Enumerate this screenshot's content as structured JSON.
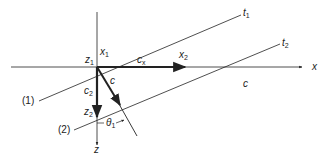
{
  "diagram": {
    "labels": {
      "x1": {
        "main": "x",
        "sub": "1"
      },
      "z1": {
        "main": "z",
        "sub": "1"
      },
      "cx": {
        "main": "c",
        "sub": "x"
      },
      "x2": {
        "main": "x",
        "sub": "2"
      },
      "c_arrow": {
        "main": "c",
        "sub": ""
      },
      "c2": {
        "main": "c",
        "sub": "2"
      },
      "z2": {
        "main": "z",
        "sub": "2"
      },
      "theta1": {
        "main": "θ",
        "sub": "1"
      },
      "t1": {
        "main": "t",
        "sub": "1"
      },
      "t2": {
        "main": "t",
        "sub": "2"
      },
      "x_axis": {
        "main": "x",
        "sub": ""
      },
      "z_axis": {
        "main": "z",
        "sub": ""
      },
      "c_medium": {
        "main": "c",
        "sub": ""
      },
      "line1": "(1)",
      "line2": "(2)"
    },
    "colors": {
      "stroke": "#222222",
      "background": "#ffffff"
    }
  }
}
